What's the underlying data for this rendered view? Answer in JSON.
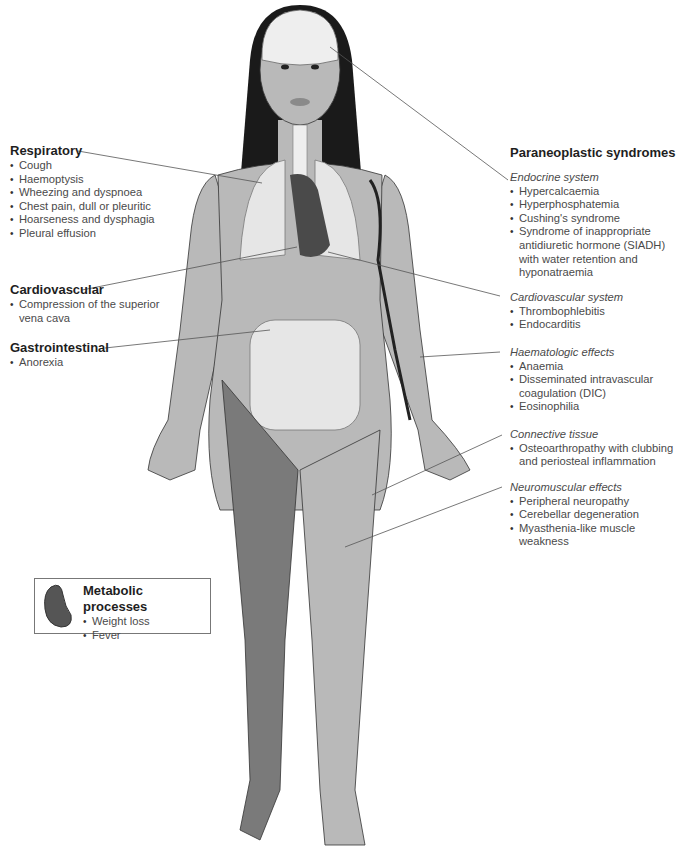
{
  "left_labels": {
    "respiratory": {
      "title": "Respiratory",
      "items": [
        "Cough",
        "Haemoptysis",
        "Wheezing and dyspnoea",
        "Chest pain, dull or pleuritic",
        "Hoarseness and dysphagia",
        "Pleural effusion"
      ]
    },
    "cardiovascular": {
      "title": "Cardiovascular",
      "items": [
        "Compression of the superior vena cava"
      ]
    },
    "gastrointestinal": {
      "title": "Gastrointestinal",
      "items": [
        "Anorexia"
      ]
    }
  },
  "right_labels": {
    "title": "Paraneoplastic syndromes",
    "endocrine": {
      "title": "Endocrine system",
      "items": [
        "Hypercalcaemia",
        "Hyperphosphatemia",
        "Cushing's syndrome",
        "Syndrome of inappropriate antidiuretic hormone (SIADH) with water retention and hyponatraemia"
      ]
    },
    "cardiovascular_system": {
      "title": "Cardiovascular system",
      "items": [
        "Thrombophlebitis",
        "Endocarditis"
      ]
    },
    "haematologic": {
      "title": "Haematologic effects",
      "items": [
        "Anaemia",
        "Disseminated intravascular coagulation (DIC)",
        "Eosinophilia"
      ]
    },
    "connective": {
      "title": "Connective tissue",
      "items": [
        "Osteoarthropathy with clubbing and periosteal inflammation"
      ]
    },
    "neuromuscular": {
      "title": "Neuromuscular effects",
      "items": [
        "Peripheral neuropathy",
        "Cerebellar degeneration",
        "Myasthenia-like muscle weakness"
      ]
    }
  },
  "metabolic_box": {
    "title": "Metabolic processes",
    "items": [
      "Weight loss",
      "Fever"
    ]
  },
  "colors": {
    "skin": "#b9b9b9",
    "hair": "#1a1a1a",
    "organs_light": "#e6e6e6",
    "heart": "#4a4a4a",
    "muscle": "#7a7a7a",
    "leader_line": "#555555"
  }
}
